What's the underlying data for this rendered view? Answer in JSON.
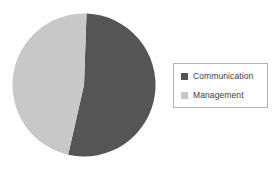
{
  "chart_data": {
    "type": "pie",
    "title": "",
    "categories": [
      "Communication",
      "Management"
    ],
    "values": [
      53,
      47
    ],
    "unit": "%",
    "colors": [
      "#555555",
      "#c8c8c8"
    ],
    "legend_position": "right",
    "grid": false,
    "labels_shown": false,
    "slices": [
      {
        "name": "Communication",
        "value": 53,
        "color": "#555555"
      },
      {
        "name": "Management",
        "value": 47,
        "color": "#c8c8c8"
      }
    ]
  },
  "legend": {
    "items": [
      {
        "label": "Communication",
        "color": "#555555"
      },
      {
        "label": "Management",
        "color": "#c8c8c8"
      }
    ]
  },
  "style": {
    "background": "#ffffff",
    "legend_border": "#b3b3b3",
    "text_color": "#3b3b3b"
  }
}
